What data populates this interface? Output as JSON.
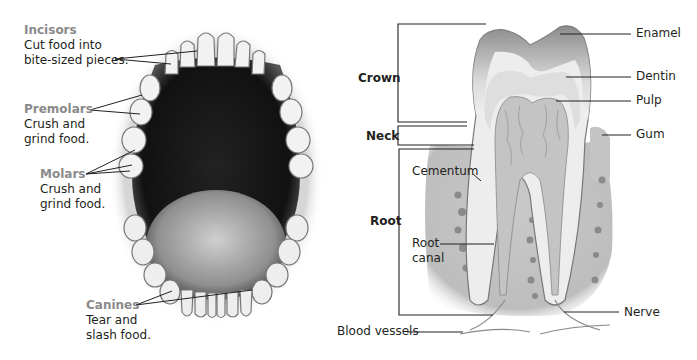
{
  "mouth": {
    "incisors": {
      "title": "Incisors",
      "desc_line1": "Cut food into",
      "desc_line2": "bite-sized pieces."
    },
    "premolars": {
      "title": "Premolars",
      "desc_line1": "Crush and",
      "desc_line2": "grind food."
    },
    "molars": {
      "title": "Molars",
      "desc_line1": "Crush and",
      "desc_line2": "grind food."
    },
    "canines": {
      "title": "Canines",
      "desc_line1": "Tear and",
      "desc_line2": "slash food."
    }
  },
  "tooth": {
    "regions": {
      "crown": "Crown",
      "neck": "Neck",
      "root": "Root"
    },
    "parts": {
      "enamel": "Enamel",
      "dentin": "Dentin",
      "pulp": "Pulp",
      "gum": "Gum",
      "cementum": "Cementum",
      "root_canal_line1": "Root",
      "root_canal_line2": "canal",
      "nerve": "Nerve",
      "blood_vessels": "Blood vessels"
    }
  },
  "colors": {
    "heading_gray": "#8a8a8a",
    "text": "#231f20"
  }
}
